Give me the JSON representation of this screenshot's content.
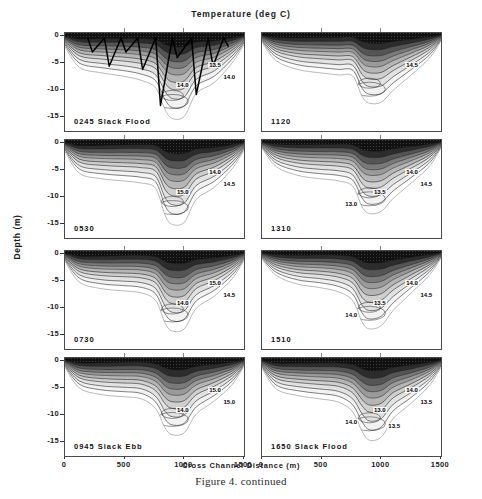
{
  "figure": {
    "title": "Temperature (deg C)",
    "caption": "Figure 4.  continued",
    "xlabel": "Cross Channel Distance (m)",
    "ylabel": "Depth (m)"
  },
  "chart_data": {
    "type": "contour",
    "title": "Temperature (deg C)",
    "xlabel": "Cross Channel Distance (m)",
    "ylabel": "Depth (m)",
    "xlim": [
      0,
      1500
    ],
    "ylim": [
      -17.5,
      0.5
    ],
    "xticks": [
      0,
      500,
      1000,
      1500
    ],
    "yticks": [
      0,
      -5,
      -10,
      -15
    ],
    "ytick_labels": [
      "0",
      "-5",
      "-10",
      "-15"
    ],
    "xtick_labels": [
      "0",
      "500",
      "1000",
      "1500"
    ],
    "grid": false,
    "contour_interval": 0.5,
    "contour_levels": [
      12.5,
      13.0,
      13.5,
      14.0,
      14.5,
      15.0,
      15.5
    ],
    "shading": "greyscale, dark = warm surface water, light = cool deep water",
    "panels": [
      {
        "id": "p0245",
        "label": "0245 Slack Flood",
        "row": 1,
        "col": 1,
        "has_ctd_casts": true,
        "cast_count": 7,
        "contour_labels": [
          "13.5",
          "14.0",
          "14.0"
        ],
        "bathymetry_x": [
          0,
          120,
          300,
          480,
          640,
          760,
          840,
          900,
          1000,
          1100,
          1250,
          1400,
          1500
        ],
        "bathymetry_depth": [
          -2.0,
          -5.8,
          -6.8,
          -7.4,
          -8.2,
          -9.6,
          -13.6,
          -15.2,
          -14.8,
          -10.6,
          -8.6,
          -5.0,
          -1.6
        ]
      },
      {
        "id": "p1120",
        "label": "1120",
        "row": 1,
        "col": 2,
        "has_ctd_casts": false,
        "contour_labels": [
          "14.5"
        ],
        "bathymetry_x": [
          0,
          120,
          300,
          480,
          640,
          760,
          840,
          900,
          1000,
          1100,
          1250,
          1400,
          1500
        ],
        "bathymetry_depth": [
          -1.2,
          -4.6,
          -6.2,
          -6.8,
          -7.2,
          -7.4,
          -11.2,
          -12.4,
          -12.2,
          -10.0,
          -7.2,
          -4.2,
          -1.0
        ]
      },
      {
        "id": "p0530",
        "label": "0530",
        "row": 2,
        "col": 1,
        "has_ctd_casts": false,
        "contour_labels": [
          "14.0",
          "14.5",
          "15.0"
        ],
        "bathymetry_x": [
          0,
          120,
          300,
          480,
          640,
          760,
          840,
          900,
          1000,
          1100,
          1250,
          1400,
          1500
        ],
        "bathymetry_depth": [
          -1.6,
          -5.6,
          -6.6,
          -7.0,
          -7.4,
          -8.4,
          -13.4,
          -15.0,
          -14.6,
          -10.4,
          -8.2,
          -4.8,
          -1.4
        ]
      },
      {
        "id": "p1310",
        "label": "1310",
        "row": 2,
        "col": 2,
        "has_ctd_casts": false,
        "contour_labels": [
          "14.0",
          "14.5",
          "13.5",
          "13.0"
        ],
        "bathymetry_x": [
          0,
          120,
          300,
          480,
          640,
          760,
          840,
          900,
          1000,
          1100,
          1250,
          1400,
          1500
        ],
        "bathymetry_depth": [
          -1.0,
          -4.4,
          -6.0,
          -6.6,
          -7.0,
          -8.0,
          -11.8,
          -13.0,
          -12.6,
          -10.2,
          -7.4,
          -4.4,
          -1.0
        ]
      },
      {
        "id": "p0730",
        "label": "0730",
        "row": 3,
        "col": 1,
        "has_ctd_casts": false,
        "contour_labels": [
          "15.0",
          "14.5",
          "14.0"
        ],
        "bathymetry_x": [
          0,
          120,
          300,
          480,
          640,
          760,
          840,
          900,
          1000,
          1100,
          1250,
          1400,
          1500
        ],
        "bathymetry_depth": [
          -1.4,
          -5.2,
          -6.4,
          -6.8,
          -7.2,
          -8.6,
          -12.8,
          -14.2,
          -13.8,
          -10.0,
          -7.8,
          -4.6,
          -1.2
        ]
      },
      {
        "id": "p1510",
        "label": "1510",
        "row": 3,
        "col": 2,
        "has_ctd_casts": false,
        "contour_labels": [
          "14.0",
          "14.5",
          "13.5",
          "14.0"
        ],
        "bathymetry_x": [
          0,
          120,
          300,
          480,
          640,
          760,
          840,
          900,
          1000,
          1100,
          1250,
          1400,
          1500
        ],
        "bathymetry_depth": [
          -1.0,
          -4.0,
          -5.6,
          -6.2,
          -7.0,
          -8.6,
          -12.6,
          -13.8,
          -13.2,
          -10.4,
          -7.2,
          -4.0,
          -0.8
        ]
      },
      {
        "id": "p0945",
        "label": "0945 Slack Ebb",
        "row": 4,
        "col": 1,
        "has_ctd_casts": false,
        "contour_labels": [
          "15.0",
          "15.0",
          "14.0"
        ],
        "bathymetry_x": [
          0,
          120,
          300,
          480,
          640,
          760,
          840,
          900,
          1000,
          1100,
          1250,
          1400,
          1500
        ],
        "bathymetry_depth": [
          -1.2,
          -5.0,
          -6.2,
          -6.6,
          -7.0,
          -8.8,
          -12.4,
          -13.6,
          -13.2,
          -9.8,
          -7.4,
          -4.4,
          -1.0
        ]
      },
      {
        "id": "p1650",
        "label": "1650 Slack Flood",
        "row": 4,
        "col": 2,
        "has_ctd_casts": false,
        "contour_labels": [
          "14.0",
          "13.5",
          "13.0",
          "14.0",
          "13.5"
        ],
        "bathymetry_x": [
          0,
          120,
          300,
          480,
          640,
          760,
          840,
          900,
          1000,
          1100,
          1250,
          1400,
          1500
        ],
        "bathymetry_depth": [
          -1.4,
          -5.2,
          -6.4,
          -7.0,
          -7.6,
          -9.4,
          -13.0,
          -14.6,
          -14.0,
          -10.6,
          -7.8,
          -4.6,
          -1.2
        ]
      }
    ]
  }
}
